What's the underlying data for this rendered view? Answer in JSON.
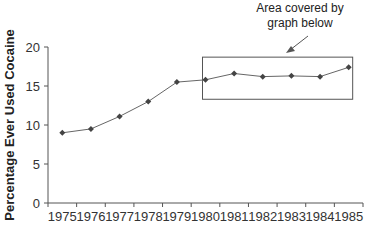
{
  "chart_data": {
    "type": "line",
    "title": "",
    "xlabel": "",
    "ylabel": "Percentage Ever Used Cocaine",
    "categories": [
      "1975",
      "1976",
      "1977",
      "1978",
      "1979",
      "1980",
      "1981",
      "1982",
      "1983",
      "1984",
      "1985"
    ],
    "series": [
      {
        "name": "Percentage Ever Used Cocaine",
        "values": [
          9.0,
          9.5,
          11.1,
          13.0,
          15.5,
          15.8,
          16.6,
          16.2,
          16.3,
          16.2,
          17.4
        ]
      }
    ],
    "ylim": [
      0,
      20
    ],
    "yticks": [
      0,
      5,
      10,
      15,
      20
    ],
    "grid": false,
    "legend": "none",
    "annotations": [
      {
        "text_lines": [
          "Area covered by",
          "graph below"
        ],
        "target": "rectangle around 1980-1985 points",
        "arrow": true
      }
    ],
    "highlight_box": {
      "x_from": "1980",
      "x_to": "1985",
      "y_from": 13.3,
      "y_to": 18.7
    }
  }
}
